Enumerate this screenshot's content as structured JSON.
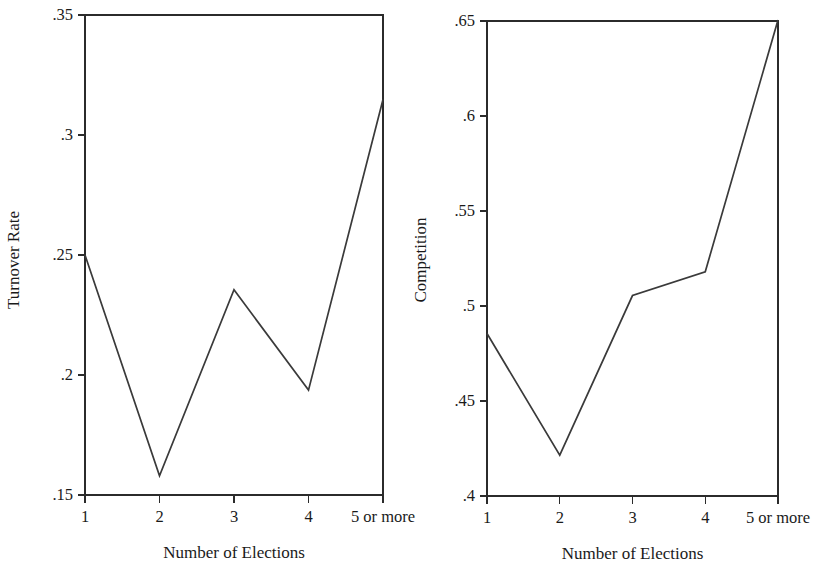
{
  "figure": {
    "background": "#ffffff",
    "line_color": "#3a3a3a",
    "axis_color": "#2b2b2b"
  },
  "chart_data": [
    {
      "type": "line",
      "title": "",
      "xlabel": "Number of Elections",
      "ylabel": "Turnover Rate",
      "categories": [
        "1",
        "2",
        "3",
        "4",
        "5 or more"
      ],
      "values": [
        0.25,
        0.158,
        0.2355,
        0.1937,
        0.3148
      ],
      "series": [
        {
          "name": "Turnover Rate",
          "values": [
            0.25,
            0.158,
            0.2355,
            0.1937,
            0.3148
          ]
        }
      ],
      "ylim": [
        0.15,
        0.35
      ],
      "yticks": [
        0.15,
        0.2,
        0.25,
        0.3,
        0.35
      ],
      "ytick_labels": [
        ".15",
        ".2",
        ".25",
        ".3",
        ".35"
      ],
      "xtick_labels": [
        "1",
        "2",
        "3",
        "4",
        "5 or more"
      ],
      "grid": false,
      "legend": "none"
    },
    {
      "type": "line",
      "title": "",
      "xlabel": "Number of Elections",
      "ylabel": "Competition",
      "categories": [
        "1",
        "2",
        "3",
        "4",
        "5 or more"
      ],
      "values": [
        0.4855,
        0.4215,
        0.5055,
        0.518,
        0.6505
      ],
      "series": [
        {
          "name": "Competition",
          "values": [
            0.4855,
            0.4215,
            0.5055,
            0.518,
            0.6505
          ]
        }
      ],
      "ylim": [
        0.4,
        0.65
      ],
      "yticks": [
        0.4,
        0.45,
        0.5,
        0.55,
        0.6,
        0.65
      ],
      "ytick_labels": [
        ".4",
        ".45",
        ".5",
        ".55",
        ".6",
        ".65"
      ],
      "xtick_labels": [
        "1",
        "2",
        "3",
        "4",
        "5 or more"
      ],
      "grid": false,
      "legend": "none"
    }
  ]
}
